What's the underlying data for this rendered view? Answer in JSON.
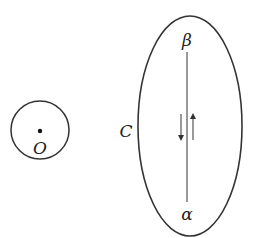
{
  "diagram": {
    "point_label": "O",
    "contour_label": "C",
    "upper_endpoint_label": "β",
    "lower_endpoint_label": "α",
    "stroke_color": "#333333"
  }
}
